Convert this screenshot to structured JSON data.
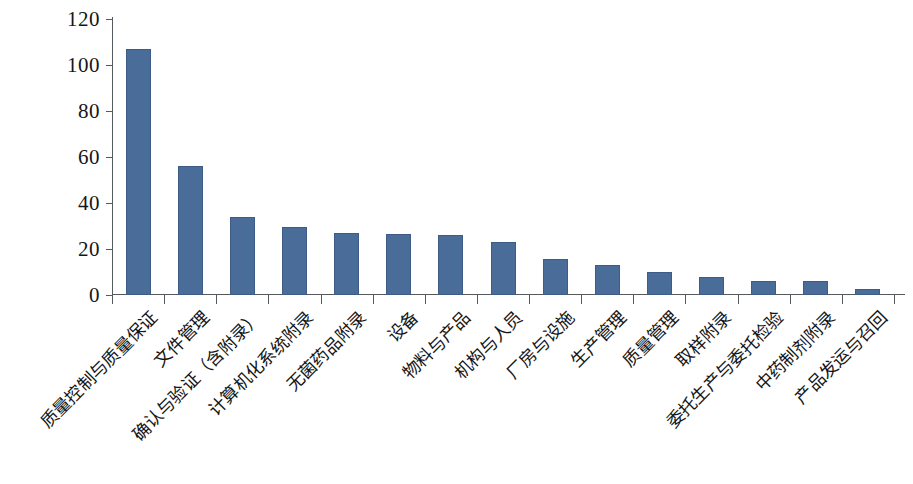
{
  "chart_data": {
    "type": "bar",
    "title": "",
    "xlabel": "",
    "ylabel": "",
    "ylim": [
      0,
      120
    ],
    "y_ticks": [
      0,
      20,
      40,
      60,
      80,
      100,
      120
    ],
    "grid": false,
    "legend": "none",
    "bar_color": "#4a6c99",
    "axis_color": "#55595c",
    "categories": [
      "质量控制与质量保证",
      "文件管理",
      "确认与验证（含附录）",
      "计算机化系统附录",
      "无菌药品附录",
      "设备",
      "物料与产品",
      "机构与人员",
      "厂房与设施",
      "生产管理",
      "质量管理",
      "取样附录",
      "委托生产与委托检验",
      "中药制剂附录",
      "产品发运与召回"
    ],
    "values": [
      107,
      56,
      34,
      29.5,
      27,
      26.5,
      26,
      23,
      15.5,
      13,
      10,
      8,
      6,
      6,
      2.5
    ]
  }
}
